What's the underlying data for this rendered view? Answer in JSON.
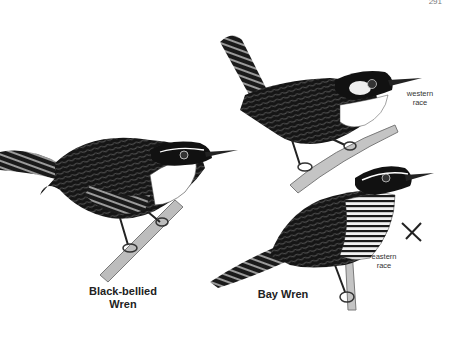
{
  "page": {
    "page_number": "291",
    "background": "#ffffff"
  },
  "birds": [
    {
      "name": "Black-bellied Wren",
      "label_line1": "Black-bellied",
      "label_line2": "Wren"
    },
    {
      "name": "Bay Wren",
      "label": "Bay Wren",
      "races": [
        {
          "label_line1": "western",
          "label_line2": "race"
        },
        {
          "label_line1": "eastern",
          "label_line2": "race"
        }
      ]
    }
  ],
  "symbols": {
    "cross_mark": "×"
  },
  "colors": {
    "ink": "#111111",
    "shade": "#3a3a3a",
    "mid": "#7a7a7a",
    "branch": "#b8b8b8",
    "white": "#ffffff"
  }
}
